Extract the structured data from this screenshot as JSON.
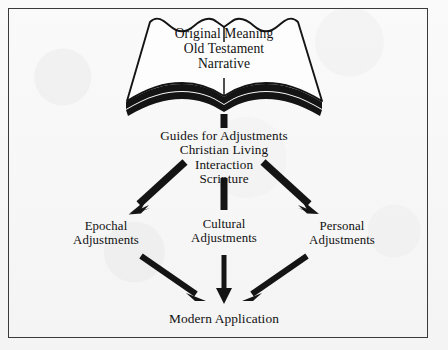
{
  "figure": {
    "type": "flow-diagram",
    "border_color": "#3a3a3a",
    "background_color": "#f4f4f4",
    "ink_color": "#111111",
    "book": {
      "icon": "open-book-icon",
      "lines": [
        "Original  Meaning",
        "Old  Testament",
        "Narrative"
      ]
    },
    "guides": {
      "lines": [
        "Guides  for  Adjustments",
        "Christian  Living",
        "Interaction",
        "Scripture"
      ]
    },
    "branches": [
      {
        "id": "epochal",
        "lines": [
          "Epochal",
          "Adjustments"
        ]
      },
      {
        "id": "cultural",
        "lines": [
          "Cultural",
          "Adjustments"
        ]
      },
      {
        "id": "personal",
        "lines": [
          "Personal",
          "Adjustments"
        ]
      }
    ],
    "outcome": {
      "label": "Modern  Application"
    },
    "connectors": [
      {
        "id": "book-to-guides",
        "shape": "vertical-bar",
        "from": "book",
        "to": "guides"
      },
      {
        "id": "guides-to-epochal",
        "shape": "arrow-diagonal",
        "from": "guides",
        "to": "epochal"
      },
      {
        "id": "guides-to-cultural",
        "shape": "vertical-bar",
        "from": "guides",
        "to": "cultural"
      },
      {
        "id": "guides-to-personal",
        "shape": "arrow-diagonal",
        "from": "guides",
        "to": "personal"
      },
      {
        "id": "epochal-to-modern",
        "shape": "arrow-diagonal",
        "from": "epochal",
        "to": "outcome"
      },
      {
        "id": "cultural-to-modern",
        "shape": "arrow-vertical",
        "from": "cultural",
        "to": "outcome"
      },
      {
        "id": "personal-to-modern",
        "shape": "arrow-diagonal",
        "from": "personal",
        "to": "outcome"
      }
    ]
  }
}
